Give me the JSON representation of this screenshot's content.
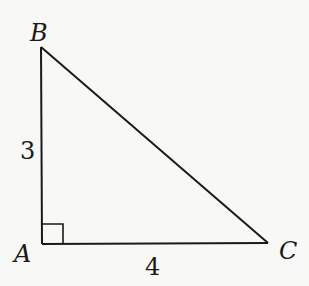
{
  "figure": {
    "type": "right-triangle",
    "stroke_color": "#1a1a1a",
    "background": "#f8f8f6",
    "vertices": [
      {
        "name": "A",
        "label": "A",
        "x": 42,
        "y": 244
      },
      {
        "name": "B",
        "label": "B",
        "x": 41,
        "y": 47
      },
      {
        "name": "C",
        "label": "C",
        "x": 268,
        "y": 243
      }
    ],
    "right_angle_at": "A",
    "sides": [
      {
        "between": "AB",
        "label": "3"
      },
      {
        "between": "AC",
        "label": "4"
      }
    ]
  },
  "labels": {
    "vertex_a": "A",
    "vertex_b": "B",
    "vertex_c": "C",
    "side_ab": "3",
    "side_ac": "4"
  }
}
